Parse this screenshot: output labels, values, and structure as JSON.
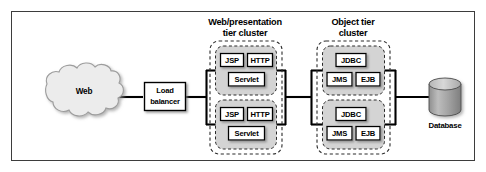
{
  "figure": {
    "frame": {
      "border_color": "#3d3d3d",
      "background": "#ffffff"
    },
    "titles": [
      {
        "id": "web-tier-title",
        "line1": "Web/presentation",
        "line2": "tier cluster"
      },
      {
        "id": "object-tier-title",
        "line1": "Object tier",
        "line2": "cluster"
      }
    ],
    "nodes": {
      "web_cloud": {
        "label": "Web",
        "fill": "#ececec",
        "stroke": "#9a9a9a"
      },
      "load_balancer": {
        "line1": "Load",
        "line2": "balancer",
        "fill": "#ffffff",
        "stroke": "#000000"
      },
      "database": {
        "label": "Database",
        "fill": "#9e9e9e",
        "top_fill": "#c6c6c6",
        "stroke": "#4a4a4a"
      }
    },
    "clusters": [
      {
        "id": "web-presentation-tier-cluster",
        "name": "Web/presentation tier cluster",
        "boundary_style": "dashed",
        "boundary_color": "#2a2a2a",
        "node_fill": "#d4d4d4",
        "instances": [
          {
            "id": "web-node-1",
            "components": [
              "JSP",
              "HTTP",
              "Servlet"
            ]
          },
          {
            "id": "web-node-2",
            "components": [
              "JSP",
              "HTTP",
              "Servlet"
            ]
          }
        ]
      },
      {
        "id": "object-tier-cluster",
        "name": "Object tier cluster",
        "boundary_style": "dashed",
        "boundary_color": "#2a2a2a",
        "node_fill": "#d4d4d4",
        "instances": [
          {
            "id": "object-node-1",
            "components": [
              "JDBC",
              "JMS",
              "EJB"
            ]
          },
          {
            "id": "object-node-2",
            "components": [
              "JDBC",
              "JMS",
              "EJB"
            ]
          }
        ]
      }
    ],
    "component_labels": {
      "jsp": "JSP",
      "http": "HTTP",
      "servlet": "Servlet",
      "jdbc": "JDBC",
      "jms": "JMS",
      "ejb": "EJB"
    },
    "connectors": {
      "stroke": "#000000",
      "description": "web-to-load-balancer, load-balancer-to-web-cluster-bus, web-cluster-to-object-cluster-bus, object-cluster-to-database"
    }
  }
}
